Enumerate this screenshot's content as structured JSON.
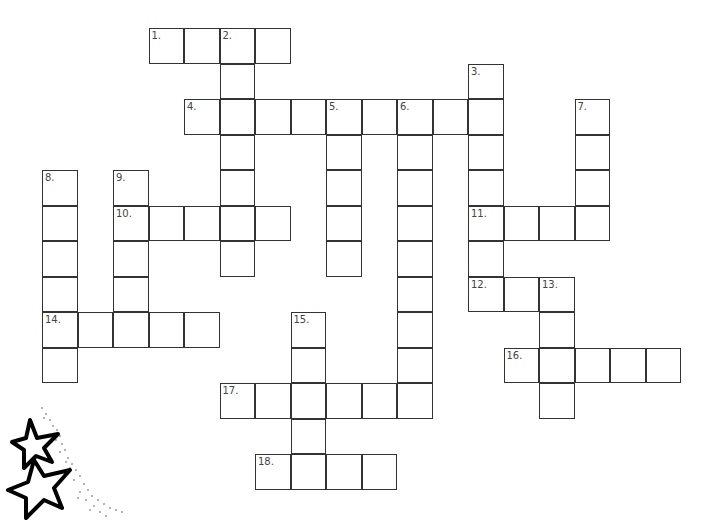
{
  "puzzle": {
    "type": "crossword",
    "cell_size": 35.5,
    "origin": {
      "x": 42,
      "y": 28
    },
    "border_color": "#333333",
    "entries": [
      {
        "number": 1,
        "direction": "across",
        "row": 0,
        "col": 3,
        "length": 4
      },
      {
        "number": 2,
        "direction": "down",
        "row": 0,
        "col": 5,
        "length": 7
      },
      {
        "number": 3,
        "direction": "down",
        "row": 1,
        "col": 12,
        "length": 7
      },
      {
        "number": 4,
        "direction": "across",
        "row": 2,
        "col": 4,
        "length": 9
      },
      {
        "number": 5,
        "direction": "down",
        "row": 2,
        "col": 8,
        "length": 5
      },
      {
        "number": 6,
        "direction": "down",
        "row": 2,
        "col": 10,
        "length": 9
      },
      {
        "number": 7,
        "direction": "down",
        "row": 2,
        "col": 15,
        "length": 4
      },
      {
        "number": 8,
        "direction": "down",
        "row": 4,
        "col": 0,
        "length": 6
      },
      {
        "number": 9,
        "direction": "down",
        "row": 4,
        "col": 2,
        "length": 5
      },
      {
        "number": 10,
        "direction": "across",
        "row": 5,
        "col": 2,
        "length": 5
      },
      {
        "number": 11,
        "direction": "across",
        "row": 5,
        "col": 12,
        "length": 4
      },
      {
        "number": 12,
        "direction": "across",
        "row": 7,
        "col": 12,
        "length": 3
      },
      {
        "number": 13,
        "direction": "down",
        "row": 7,
        "col": 14,
        "length": 4
      },
      {
        "number": 14,
        "direction": "across",
        "row": 8,
        "col": 0,
        "length": 5
      },
      {
        "number": 15,
        "direction": "down",
        "row": 8,
        "col": 7,
        "length": 5
      },
      {
        "number": 16,
        "direction": "across",
        "row": 9,
        "col": 13,
        "length": 5
      },
      {
        "number": 17,
        "direction": "across",
        "row": 10,
        "col": 5,
        "length": 6
      },
      {
        "number": 18,
        "direction": "across",
        "row": 12,
        "col": 6,
        "length": 4
      }
    ]
  },
  "decoration": {
    "icon": "shooting-stars-icon"
  }
}
